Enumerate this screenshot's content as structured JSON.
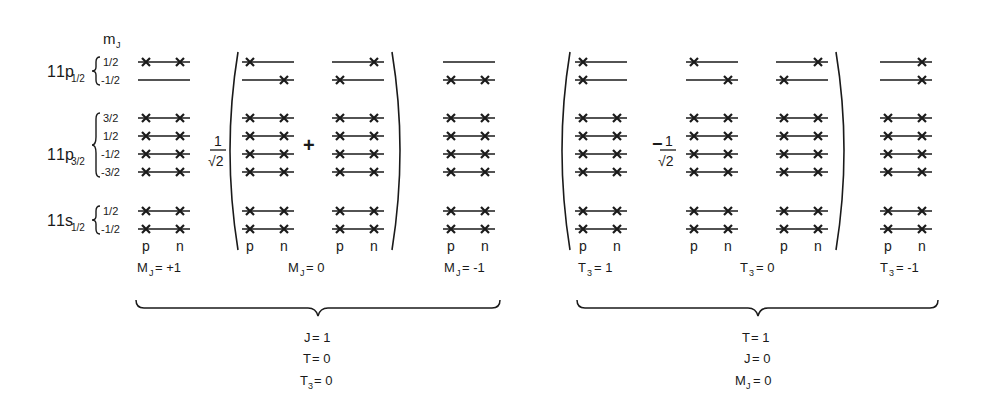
{
  "figure": {
    "mj_header": "m",
    "mj_header_sub": "J",
    "shells": [
      {
        "name": "1p",
        "sub": "1/2",
        "mj": [
          "1/2",
          "-1/2"
        ]
      },
      {
        "name": "1p",
        "sub": "3/2",
        "mj": [
          "3/2",
          "1/2",
          "-1/2",
          "-3/2"
        ]
      },
      {
        "name": "1s",
        "sub": "1/2",
        "mj": [
          "1/2",
          "-1/2"
        ]
      }
    ],
    "pn_labels": {
      "p": "p",
      "n": "n"
    },
    "prefactor": {
      "num": "1",
      "den": "√2"
    },
    "left_group": {
      "operator": "+",
      "columns": [
        {
          "label_main": "M",
          "label_sub": "J",
          "label_value": "= +1"
        },
        {
          "label_main": "M",
          "label_sub": "J",
          "label_value": "= 0"
        },
        {
          "label_main": "M",
          "label_sub": "J",
          "label_value": "= -1"
        }
      ],
      "quantum_numbers": [
        {
          "main": "J",
          "sub": "",
          "value": "= 1"
        },
        {
          "main": "T",
          "sub": "",
          "value": "= 0"
        },
        {
          "main": "T",
          "sub": "3",
          "value": "= 0"
        }
      ]
    },
    "right_group": {
      "operator": "−",
      "columns": [
        {
          "label_main": "T",
          "label_sub": "3",
          "label_value": "= 1"
        },
        {
          "label_main": "T",
          "label_sub": "3",
          "label_value": "= 0"
        },
        {
          "label_main": "T",
          "label_sub": "3",
          "label_value": "= -1"
        }
      ],
      "quantum_numbers": [
        {
          "main": "T",
          "sub": "",
          "value": "= 1"
        },
        {
          "main": "J",
          "sub": "",
          "value": "= 0"
        },
        {
          "main": "M",
          "sub": "J",
          "value": "= 0"
        }
      ]
    },
    "occupancy_legend": "rows: 1p1/2(+1/2,-1/2), 1p3/2(+3/2..-3/2), 1s1/2(+1/2,-1/2); entries [p,n] occupied=1",
    "configurations": [
      {
        "id": "MJ+1",
        "rows": [
          [
            1,
            1
          ],
          [
            0,
            0
          ],
          [
            1,
            1
          ],
          [
            1,
            1
          ],
          [
            1,
            1
          ],
          [
            1,
            1
          ],
          [
            1,
            1
          ],
          [
            1,
            1
          ]
        ]
      },
      {
        "id": "MJ0-a",
        "rows": [
          [
            1,
            0
          ],
          [
            0,
            1
          ],
          [
            1,
            1
          ],
          [
            1,
            1
          ],
          [
            1,
            1
          ],
          [
            1,
            1
          ],
          [
            1,
            1
          ],
          [
            1,
            1
          ]
        ]
      },
      {
        "id": "MJ0-b",
        "rows": [
          [
            0,
            1
          ],
          [
            1,
            0
          ],
          [
            1,
            1
          ],
          [
            1,
            1
          ],
          [
            1,
            1
          ],
          [
            1,
            1
          ],
          [
            1,
            1
          ],
          [
            1,
            1
          ]
        ]
      },
      {
        "id": "MJ-1",
        "rows": [
          [
            0,
            0
          ],
          [
            1,
            1
          ],
          [
            1,
            1
          ],
          [
            1,
            1
          ],
          [
            1,
            1
          ],
          [
            1,
            1
          ],
          [
            1,
            1
          ],
          [
            1,
            1
          ]
        ]
      },
      {
        "id": "T3+1",
        "rows": [
          [
            1,
            0
          ],
          [
            1,
            0
          ],
          [
            1,
            1
          ],
          [
            1,
            1
          ],
          [
            1,
            1
          ],
          [
            1,
            1
          ],
          [
            1,
            1
          ],
          [
            1,
            1
          ]
        ]
      },
      {
        "id": "T3_0-a",
        "rows": [
          [
            1,
            0
          ],
          [
            0,
            1
          ],
          [
            1,
            1
          ],
          [
            1,
            1
          ],
          [
            1,
            1
          ],
          [
            1,
            1
          ],
          [
            1,
            1
          ],
          [
            1,
            1
          ]
        ]
      },
      {
        "id": "T3_0-b",
        "rows": [
          [
            0,
            1
          ],
          [
            1,
            0
          ],
          [
            1,
            1
          ],
          [
            1,
            1
          ],
          [
            1,
            1
          ],
          [
            1,
            1
          ],
          [
            1,
            1
          ],
          [
            1,
            1
          ]
        ]
      },
      {
        "id": "T3-1",
        "rows": [
          [
            0,
            1
          ],
          [
            0,
            1
          ],
          [
            1,
            1
          ],
          [
            1,
            1
          ],
          [
            1,
            1
          ],
          [
            1,
            1
          ],
          [
            1,
            1
          ],
          [
            1,
            1
          ]
        ]
      }
    ]
  }
}
